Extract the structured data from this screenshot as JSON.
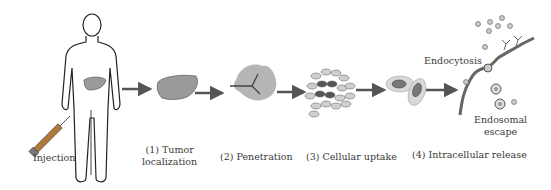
{
  "labels": {
    "injection": "Injection",
    "step1_line1": "(1) Tumor",
    "step1_line2": "localization",
    "step2": "(2) Penetration",
    "step3": "(3) Cellular uptake",
    "step4": "(4) Intracellular release",
    "endocytosis": "Endocytosis",
    "endosomal_line1": "Endosomal",
    "endosomal_line2": "escape"
  },
  "colors": {
    "organ_fill": "#9a9a9a",
    "tumor_fill": "#b5b5b5",
    "cell_fill": "#cfcfcf",
    "nucleus_fill": "#6e6e6e",
    "outline": "#222222",
    "arrow": "#555555"
  }
}
